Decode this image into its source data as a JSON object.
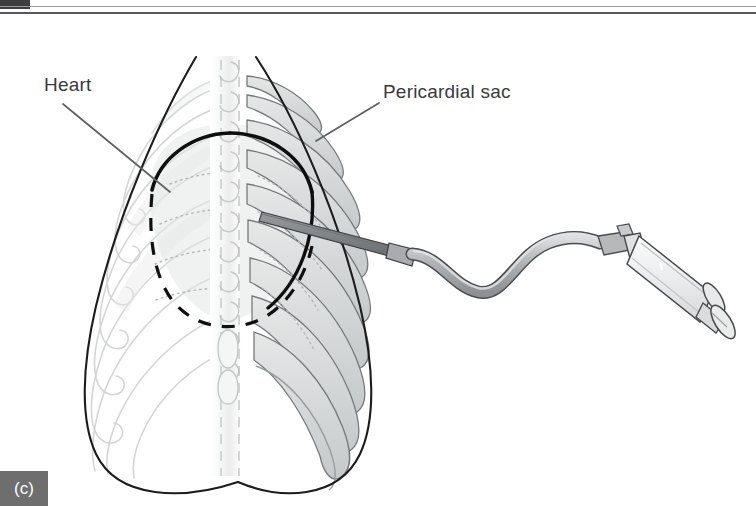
{
  "figure": {
    "panel_tag": "(c)",
    "title_text": "Pericardiocentesis — needle and syringe approach to the pericardial sac",
    "labels": {
      "heart": "Heart",
      "pericardial_sac": "Pericardial sac"
    },
    "colors": {
      "background": "#ffffff",
      "label_text": "#3a3a3c",
      "panel_tag_bg": "#6e6e6e",
      "panel_tag_text": "#ffffff",
      "outline_dark": "#1a1a1a",
      "leader_line": "#5a5a5c",
      "rib_near_fill": "#d7d9da",
      "rib_near_stroke": "#6f7274",
      "rib_far_fill": "#f2f3f3",
      "rib_far_stroke": "#d2d4d5",
      "spine_fill": "#f3f4f4",
      "spine_stroke": "#c9cbcc",
      "heart_fill": "#e2e4e4",
      "heart_dash": "#111111",
      "needle_fill": "#8d9092",
      "needle_stroke": "#3c3f41",
      "tubing_fill": "#b9bbbd",
      "tubing_stroke": "#4a4c4e",
      "syringe_barrel": "#eceded",
      "syringe_stroke": "#4a4c4e",
      "syringe_hub": "#b6b8ba",
      "top_rule": "#58585a"
    },
    "elements": [
      "body-outline",
      "vertebral-column",
      "near-ribs",
      "far-ribs",
      "sternum",
      "heart-dashed-outline",
      "pericardial-sac-outline",
      "needle",
      "tubing",
      "syringe"
    ]
  }
}
